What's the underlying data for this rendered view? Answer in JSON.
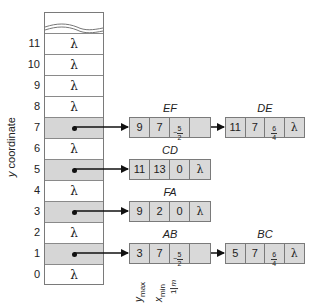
{
  "axis": {
    "ylabel_var": "y",
    "ylabel_rest": " coordinate"
  },
  "buckets": [
    {
      "y": "11",
      "value": "λ",
      "shaded": false
    },
    {
      "y": "10",
      "value": "λ",
      "shaded": false
    },
    {
      "y": "9",
      "value": "λ",
      "shaded": false
    },
    {
      "y": "8",
      "value": "λ",
      "shaded": false
    },
    {
      "y": "7",
      "value": "",
      "shaded": true,
      "points_to": "EF"
    },
    {
      "y": "6",
      "value": "λ",
      "shaded": false
    },
    {
      "y": "5",
      "value": "",
      "shaded": true,
      "points_to": "CD"
    },
    {
      "y": "4",
      "value": "λ",
      "shaded": false
    },
    {
      "y": "3",
      "value": "",
      "shaded": true,
      "points_to": "FA"
    },
    {
      "y": "2",
      "value": "λ",
      "shaded": false
    },
    {
      "y": "1",
      "value": "",
      "shaded": true,
      "points_to": "AB"
    },
    {
      "y": "0",
      "value": "λ",
      "shaded": false
    }
  ],
  "nodes": {
    "EF": {
      "label": "EF",
      "ymax": "9",
      "xmin": "7",
      "inv_m_sign": "−",
      "inv_m_num": "5",
      "inv_m_den": "2",
      "next": "DE"
    },
    "DE": {
      "label": "DE",
      "ymax": "11",
      "xmin": "7",
      "inv_m_sign": "",
      "inv_m_num": "6",
      "inv_m_den": "4",
      "next": "λ"
    },
    "CD": {
      "label": "CD",
      "ymax": "11",
      "xmin": "13",
      "inv_m": "0",
      "next": "λ"
    },
    "FA": {
      "label": "FA",
      "ymax": "9",
      "xmin": "2",
      "inv_m": "0",
      "next": "λ"
    },
    "AB": {
      "label": "AB",
      "ymax": "3",
      "xmin": "7",
      "inv_m_sign": "−",
      "inv_m_num": "5",
      "inv_m_den": "2",
      "next": "BC"
    },
    "BC": {
      "label": "BC",
      "ymax": "5",
      "xmin": "7",
      "inv_m_sign": "",
      "inv_m_num": "6",
      "inv_m_den": "4",
      "next": "λ"
    }
  },
  "field_labels": {
    "ymax_var": "y",
    "ymax_sub": "max",
    "xmin_var": "x",
    "xmin_sub": "min",
    "invm_num": "1",
    "invm_den": "m"
  },
  "colors": {
    "shade": "#d6d6d6",
    "node_fill": "#d9d9d9",
    "border": "#7a7a7a",
    "arrow": "#111111"
  }
}
